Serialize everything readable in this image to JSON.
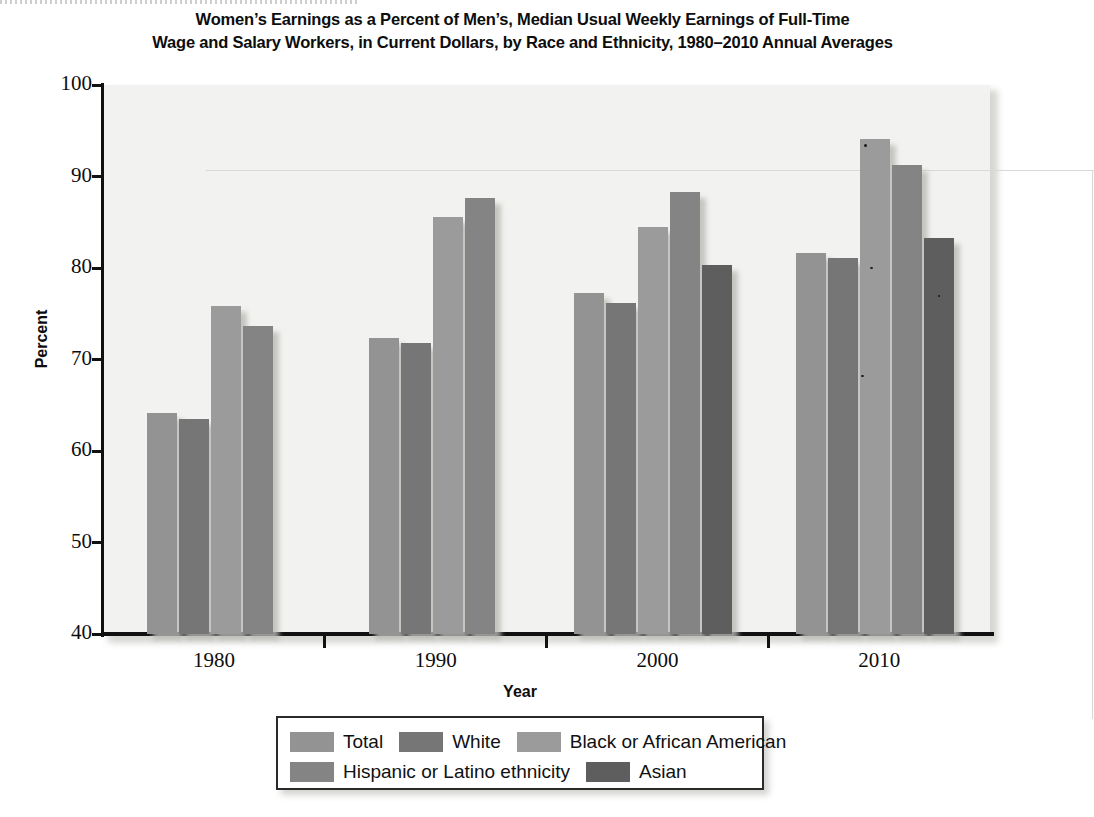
{
  "chart_data": {
    "type": "bar",
    "title_lines": [
      "Women’s Earnings as a Percent of Men’s, Median Usual Weekly Earnings of Full-Time",
      "Wage and Salary Workers, in Current Dollars, by Race and Ethnicity, 1980–2010 Annual Averages"
    ],
    "xlabel": "Year",
    "ylabel": "Percent",
    "categories": [
      "1980",
      "1990",
      "2000",
      "2010"
    ],
    "ylim": [
      40,
      100
    ],
    "yticks": [
      40,
      50,
      60,
      70,
      80,
      90,
      100
    ],
    "ytick_labels": [
      "40",
      "50",
      "60",
      "70",
      "80",
      "90",
      "100"
    ],
    "grid": false,
    "legend_position": "bottom",
    "series": [
      {
        "name": "Total",
        "color": "#939393",
        "values": [
          64.2,
          72.3,
          77.3,
          81.6
        ]
      },
      {
        "name": "White",
        "color": "#767676",
        "values": [
          63.5,
          71.8,
          76.2,
          81.1
        ]
      },
      {
        "name": "Black or African American",
        "color": "#9b9b9b",
        "values": [
          75.8,
          85.6,
          84.5,
          94.1
        ]
      },
      {
        "name": "Hispanic or Latino ethnicity",
        "color": "#848484",
        "values": [
          73.7,
          87.7,
          88.3,
          91.3
        ]
      },
      {
        "name": "Asian",
        "color": "#5e5e5e",
        "values": [
          null,
          null,
          80.3,
          83.3
        ]
      }
    ]
  },
  "legend": {
    "row1": [
      {
        "label": "Total",
        "color": "#939393"
      },
      {
        "label": "White",
        "color": "#767676"
      },
      {
        "label": "Black or African American",
        "color": "#9b9b9b"
      }
    ],
    "row2": [
      {
        "label": "Hispanic or Latino ethnicity",
        "color": "#848484"
      },
      {
        "label": "Asian",
        "color": "#5e5e5e"
      }
    ]
  }
}
